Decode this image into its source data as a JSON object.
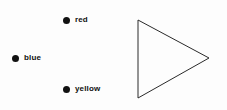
{
  "background_color": "#fdfdfd",
  "legend": {
    "items": [
      {
        "label": "red",
        "marker": "filled-circle",
        "marker_color": "#111111"
      },
      {
        "label": "blue",
        "marker": "filled-circle",
        "marker_color": "#111111"
      },
      {
        "label": "yellow",
        "marker": "filled-circle",
        "marker_color": "#111111"
      }
    ]
  },
  "shape": {
    "name": "triangle",
    "direction": "right-pointing",
    "fill": "none",
    "stroke_color": "#2a2a2a",
    "stroke_width": 1,
    "vertices": [
      {
        "x": 138,
        "y": 20
      },
      {
        "x": 138,
        "y": 98
      },
      {
        "x": 209,
        "y": 58
      }
    ]
  }
}
